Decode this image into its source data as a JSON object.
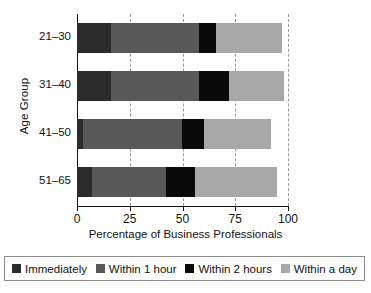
{
  "chart_data": {
    "type": "bar",
    "orientation": "horizontal",
    "stacked": true,
    "title": "",
    "xlabel": "Percentage of Business Professionals",
    "ylabel": "Age Group",
    "categories": [
      "21–30",
      "31–40",
      "41–50",
      "51–65"
    ],
    "xlim": [
      0,
      100
    ],
    "xticks": [
      0,
      25,
      50,
      75,
      100
    ],
    "xticklabels": [
      "0",
      "25",
      "50",
      "75",
      "100"
    ],
    "grid": "vertical-dashed",
    "legend_position": "bottom",
    "series": [
      {
        "name": "Immediately",
        "color": "#2b2b2b",
        "values": [
          16,
          16,
          3,
          7
        ]
      },
      {
        "name": "Within 1 hour",
        "color": "#585858",
        "values": [
          42,
          42,
          47,
          35
        ]
      },
      {
        "name": "Within 2 hours",
        "color": "#0a0a0a",
        "values": [
          8,
          14,
          10,
          14
        ]
      },
      {
        "name": "Within a day",
        "color": "#a8a8a8",
        "values": [
          31,
          26,
          32,
          39
        ]
      }
    ]
  },
  "axes": {
    "xlabel": "Percentage of Business Professionals",
    "ylabel": "Age Group"
  },
  "legend": {
    "items": [
      {
        "label": "Immediately",
        "color": "#2b2b2b"
      },
      {
        "label": "Within 1 hour",
        "color": "#585858"
      },
      {
        "label": "Within 2 hours",
        "color": "#0a0a0a"
      },
      {
        "label": "Within a day",
        "color": "#a8a8a8"
      }
    ]
  }
}
